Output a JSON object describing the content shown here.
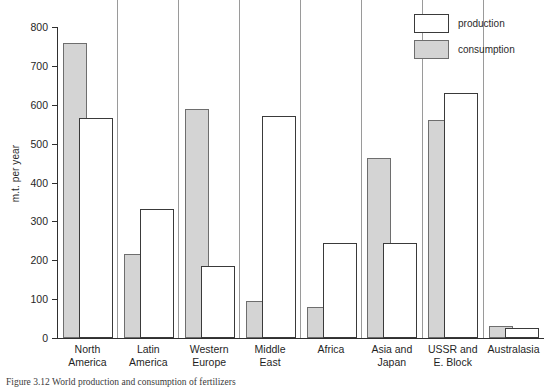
{
  "figure": {
    "caption": "Figure 3.12 World production and consumption of fertilizers"
  },
  "legend": {
    "position": "top-right",
    "entries": [
      {
        "label": "production",
        "swatch": "white-square-icon"
      },
      {
        "label": "consumption",
        "swatch": "gray-square-icon"
      }
    ]
  },
  "axis": {
    "ylabel": "m.t. per year",
    "yticks": [
      "0",
      "100",
      "200",
      "300",
      "400",
      "500",
      "600",
      "700",
      "800"
    ]
  },
  "chart_data": {
    "type": "bar",
    "title": "",
    "xlabel": "",
    "ylabel": "m.t. per year",
    "ylim": [
      0,
      800
    ],
    "ytick_step": 100,
    "grid": false,
    "legend_position": "top-right",
    "categories": [
      "North\nAmerica",
      "Latin\nAmerica",
      "Western\nEurope",
      "Middle\nEast",
      "Africa",
      "Asia and\nJapan",
      "USSR and\nE. Block",
      "Australasia"
    ],
    "series": [
      {
        "name": "consumption",
        "color": "#d4d4d4",
        "values": [
          760,
          215,
          590,
          95,
          80,
          462,
          560,
          30
        ]
      },
      {
        "name": "production",
        "color": "#ffffff",
        "values": [
          565,
          333,
          185,
          572,
          245,
          245,
          630,
          25
        ]
      }
    ]
  }
}
